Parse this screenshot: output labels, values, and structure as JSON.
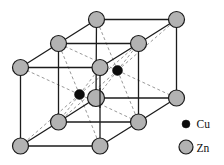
{
  "figure": {
    "width": 224,
    "height": 165,
    "background": "#ffffff"
  },
  "colors": {
    "zn_fill": "#b2b2b2",
    "cu_fill": "#0c0c0c",
    "atom_outline": "#1a1a1a",
    "solid_edge": "#1c1c1c",
    "dashed_line": "#7f7f7f"
  },
  "crystal": {
    "structure_type": "CsCl-type (beta-brass CuZn), two stacked unit cells",
    "corner_atoms": [
      {
        "x": 20.5,
        "y": 67.5,
        "r": 8,
        "element": "Zn"
      },
      {
        "x": 100,
        "y": 67.5,
        "r": 8,
        "element": "Zn"
      },
      {
        "x": 20.5,
        "y": 146,
        "r": 8,
        "element": "Zn"
      },
      {
        "x": 100,
        "y": 146,
        "r": 8,
        "element": "Zn"
      },
      {
        "x": 58.5,
        "y": 43.5,
        "r": 8,
        "element": "Zn"
      },
      {
        "x": 138.5,
        "y": 43.5,
        "r": 8,
        "element": "Zn"
      },
      {
        "x": 58.5,
        "y": 122,
        "r": 8,
        "element": "Zn"
      },
      {
        "x": 138.5,
        "y": 122,
        "r": 8,
        "element": "Zn"
      },
      {
        "x": 96.5,
        "y": 19.5,
        "r": 8,
        "element": "Zn"
      },
      {
        "x": 176.5,
        "y": 19.5,
        "r": 8,
        "element": "Zn"
      },
      {
        "x": 96,
        "y": 98,
        "r": 8.5,
        "element": "Zn"
      },
      {
        "x": 176.5,
        "y": 98,
        "r": 8,
        "element": "Zn"
      }
    ],
    "center_atoms": [
      {
        "x": 79.5,
        "y": 94.5,
        "r": 5,
        "element": "Cu"
      },
      {
        "x": 117.5,
        "y": 70.5,
        "r": 5,
        "element": "Cu"
      }
    ],
    "edges": [
      [
        0,
        2
      ],
      [
        1,
        3
      ],
      [
        4,
        6
      ],
      [
        5,
        7
      ],
      [
        8,
        10
      ],
      [
        9,
        11
      ],
      [
        0,
        1
      ],
      [
        4,
        5
      ],
      [
        8,
        9
      ],
      [
        2,
        3
      ],
      [
        6,
        7
      ],
      [
        10,
        11
      ],
      [
        0,
        4
      ],
      [
        4,
        8
      ],
      [
        1,
        5
      ],
      [
        5,
        9
      ],
      [
        2,
        6
      ],
      [
        6,
        10
      ],
      [
        3,
        7
      ],
      [
        7,
        11
      ]
    ],
    "diagonals": [
      {
        "center": 0,
        "corners": [
          0,
          1,
          2,
          3,
          4,
          5,
          6,
          7
        ]
      },
      {
        "center": 1,
        "corners": [
          4,
          5,
          6,
          7,
          8,
          9,
          10,
          11
        ]
      }
    ],
    "front_overlay_edge": {
      "x1": 100,
      "y1": 88,
      "x2": 100,
      "y2": 108
    },
    "solid_width": 1.3,
    "dashed_width": 0.8,
    "dash_pattern": "3,2.5"
  },
  "legend": {
    "items": [
      {
        "label": "Cu",
        "marker": "cu-dot",
        "cx": 186,
        "cy": 124,
        "r": 4,
        "text_x": 196.5,
        "text_y": 128
      },
      {
        "label": "Zn",
        "marker": "zn-circle",
        "cx": 186,
        "cy": 147,
        "r": 7,
        "text_x": 196.5,
        "text_y": 151.5
      }
    ]
  }
}
